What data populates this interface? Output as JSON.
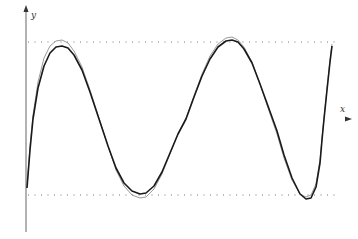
{
  "chart_data": {
    "type": "line",
    "title": "",
    "xlabel": "x",
    "ylabel": "y",
    "grid": false,
    "legend": null,
    "reference_lines": [
      {
        "name": "upper-bound",
        "style": "dotted",
        "y_px": 42
      },
      {
        "name": "lower-bound",
        "style": "dotted",
        "y_px": 195
      }
    ],
    "series": [
      {
        "name": "curve-main",
        "color": "#1a1a1a",
        "width": 1.6,
        "points_px": [
          [
            27,
            188
          ],
          [
            30,
            150
          ],
          [
            33,
            119
          ],
          [
            38,
            88
          ],
          [
            44,
            66
          ],
          [
            50,
            53
          ],
          [
            56,
            47
          ],
          [
            62,
            46
          ],
          [
            68,
            48
          ],
          [
            74,
            55
          ],
          [
            82,
            70
          ],
          [
            90,
            92
          ],
          [
            99,
            119
          ],
          [
            108,
            146
          ],
          [
            116,
            168
          ],
          [
            124,
            183
          ],
          [
            132,
            191
          ],
          [
            140,
            194
          ],
          [
            146,
            193
          ],
          [
            154,
            186
          ],
          [
            162,
            172
          ],
          [
            170,
            153
          ],
          [
            178,
            134
          ],
          [
            186,
            119
          ],
          [
            194,
            97
          ],
          [
            202,
            76
          ],
          [
            210,
            59
          ],
          [
            218,
            47
          ],
          [
            226,
            41
          ],
          [
            232,
            40
          ],
          [
            238,
            42
          ],
          [
            244,
            49
          ],
          [
            252,
            63
          ],
          [
            260,
            84
          ],
          [
            268,
            106
          ],
          [
            277,
            131
          ],
          [
            284,
            155
          ],
          [
            292,
            178
          ],
          [
            300,
            194
          ],
          [
            306,
            199
          ],
          [
            311,
            198
          ],
          [
            316,
            187
          ],
          [
            320,
            163
          ],
          [
            322,
            140
          ],
          [
            324,
            119
          ],
          [
            327,
            90
          ],
          [
            330,
            62
          ],
          [
            332,
            46
          ]
        ]
      },
      {
        "name": "curve-approx",
        "color": "#9a9a9a",
        "width": 1.0,
        "points_px": [
          [
            27,
            186
          ],
          [
            30,
            146
          ],
          [
            33,
            115
          ],
          [
            38,
            82
          ],
          [
            44,
            58
          ],
          [
            50,
            46
          ],
          [
            56,
            41
          ],
          [
            62,
            40
          ],
          [
            68,
            43
          ],
          [
            74,
            51
          ],
          [
            82,
            67
          ],
          [
            90,
            90
          ],
          [
            99,
            118
          ],
          [
            108,
            146
          ],
          [
            116,
            170
          ],
          [
            124,
            186
          ],
          [
            132,
            195
          ],
          [
            140,
            198
          ],
          [
            146,
            197
          ],
          [
            154,
            189
          ],
          [
            162,
            174
          ],
          [
            170,
            154
          ],
          [
            178,
            134
          ],
          [
            186,
            118
          ],
          [
            194,
            96
          ],
          [
            202,
            74
          ],
          [
            210,
            56
          ],
          [
            218,
            44
          ],
          [
            226,
            38
          ],
          [
            232,
            37
          ],
          [
            238,
            40
          ],
          [
            244,
            47
          ],
          [
            252,
            62
          ],
          [
            260,
            84
          ],
          [
            268,
            108
          ],
          [
            277,
            134
          ],
          [
            284,
            158
          ],
          [
            292,
            180
          ],
          [
            300,
            194
          ],
          [
            306,
            197
          ],
          [
            311,
            195
          ],
          [
            316,
            184
          ],
          [
            320,
            160
          ],
          [
            322,
            138
          ],
          [
            324,
            118
          ],
          [
            327,
            88
          ],
          [
            330,
            60
          ],
          [
            332,
            44
          ]
        ]
      }
    ],
    "axes": {
      "x_axis_y_px": 119,
      "y_axis_x_px": 26
    }
  },
  "labels": {
    "x": "x",
    "y": "y"
  },
  "colors": {
    "axis": "#555555",
    "dots": "#777777",
    "highlight_magenta": "#cc44cc",
    "highlight_green": "#ccee88"
  }
}
